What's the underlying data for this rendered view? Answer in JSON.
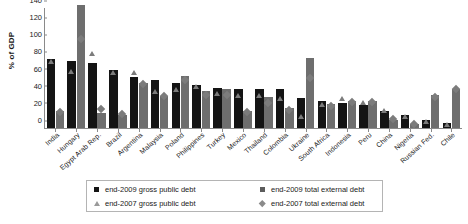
{
  "chart_data": {
    "type": "bar",
    "title": "",
    "xlabel": "",
    "ylabel": "% of GDP",
    "ylim": [
      0,
      140
    ],
    "yticks": [
      0,
      20,
      40,
      60,
      80,
      100,
      120,
      140
    ],
    "grid": false,
    "legend_position": "bottom",
    "categories": [
      "India",
      "Hungary",
      "Egypt Arab Rep.",
      "Brazil",
      "Argentina",
      "Malaysia",
      "Poland",
      "Philippines",
      "Turkey",
      "Mexico",
      "Thailand",
      "Colombia",
      "Ukraine",
      "South Africa",
      "Indonesia",
      "Peru",
      "China",
      "Nigeria",
      "Russian Fed.",
      "Chile"
    ],
    "series": [
      {
        "name": "end-2009 gross public debt",
        "marker": "square",
        "color": "#141414",
        "values": [
          80,
          78,
          76,
          68,
          60,
          56,
          52,
          50,
          47,
          45,
          45,
          45,
          35,
          31,
          29,
          27,
          20,
          15,
          9,
          6
        ]
      },
      {
        "name": "end-2009 total external debt",
        "marker": "square",
        "color": "#6e6e6e",
        "values": [
          20,
          144,
          17,
          15,
          52,
          37,
          61,
          43,
          46,
          20,
          36,
          23,
          82,
          28,
          32,
          32,
          9,
          5,
          38,
          46
        ]
      },
      {
        "name": "end-2007 gross public debt",
        "marker": "triangle",
        "color": "#7c7c7c",
        "values": [
          78,
          66,
          87,
          65,
          65,
          43,
          45,
          49,
          40,
          38,
          38,
          35,
          13,
          28,
          35,
          30,
          20,
          13,
          8,
          4
        ]
      },
      {
        "name": "end-2007 total external debt",
        "marker": "diamond",
        "color": "#7c7c7c",
        "values": [
          19,
          104,
          22,
          16,
          51,
          37,
          56,
          39,
          39,
          19,
          29,
          21,
          58,
          26,
          30,
          30,
          11,
          5,
          36,
          46
        ]
      }
    ]
  },
  "legend": {
    "entries": [
      {
        "label": "end-2009 gross public debt",
        "symbol": "square-black"
      },
      {
        "label": "end-2009 total external debt",
        "symbol": "square-gray"
      },
      {
        "label": "end-2007 gross public debt",
        "symbol": "triangle-gray"
      },
      {
        "label": "end-2007 total external debt",
        "symbol": "diamond-gray"
      }
    ]
  }
}
